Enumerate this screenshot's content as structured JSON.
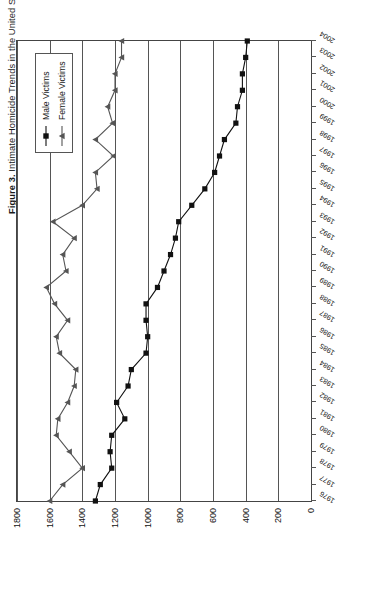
{
  "figure": {
    "label": "Figure 3.",
    "caption": "Intimate Homicide Trends in the United States, 1976–2004"
  },
  "legend": {
    "position": "top-center-inside",
    "entries": [
      {
        "name": "male-victims",
        "label": "Male Victims",
        "marker": "filled-square",
        "color": "#111111"
      },
      {
        "name": "female-victims",
        "label": "Female Victims",
        "marker": "filled-triangle",
        "color": "#555555"
      }
    ]
  },
  "chart_data": {
    "type": "line",
    "title": "Intimate Homicide Trends in the United States, 1976–2004",
    "xlabel": "",
    "ylabel": "",
    "grid": true,
    "orientation": "page-rotated-90-ccw",
    "xlim": [
      1976,
      2004
    ],
    "ylim": [
      0,
      1800
    ],
    "ytick_labels": [
      "0",
      "200",
      "400",
      "600",
      "800",
      "1000",
      "1200",
      "1400",
      "1600",
      "1800"
    ],
    "ytick_values": [
      0,
      200,
      400,
      600,
      800,
      1000,
      1200,
      1400,
      1600,
      1800
    ],
    "x": [
      1976,
      1977,
      1978,
      1979,
      1980,
      1981,
      1982,
      1983,
      1984,
      1985,
      1986,
      1987,
      1988,
      1989,
      1990,
      1991,
      1992,
      1993,
      1994,
      1995,
      1996,
      1997,
      1998,
      1999,
      2000,
      2001,
      2002,
      2003,
      2004
    ],
    "categories": [
      "1976",
      "1977",
      "1978",
      "1979",
      "1980",
      "1981",
      "1982",
      "1983",
      "1984",
      "1985",
      "1986",
      "1987",
      "1988",
      "1989",
      "1990",
      "1991",
      "1992",
      "1993",
      "1994",
      "1995",
      "1996",
      "1997",
      "1998",
      "1999",
      "2000",
      "2001",
      "2002",
      "2003",
      "2004"
    ],
    "series": [
      {
        "name": "Male Victims",
        "marker": "filled-square",
        "color": "#111111",
        "values": [
          1320,
          1290,
          1220,
          1230,
          1220,
          1140,
          1190,
          1120,
          1100,
          1010,
          1000,
          1010,
          1010,
          940,
          900,
          860,
          830,
          810,
          730,
          650,
          590,
          560,
          530,
          460,
          450,
          420,
          420,
          400,
          390
        ]
      },
      {
        "name": "Female Victims",
        "marker": "filled-triangle",
        "color": "#555555",
        "values": [
          1600,
          1520,
          1400,
          1480,
          1560,
          1550,
          1490,
          1450,
          1440,
          1540,
          1560,
          1490,
          1570,
          1620,
          1500,
          1520,
          1450,
          1580,
          1400,
          1310,
          1320,
          1210,
          1320,
          1215,
          1245,
          1200,
          1200,
          1160,
          1160
        ]
      }
    ]
  }
}
